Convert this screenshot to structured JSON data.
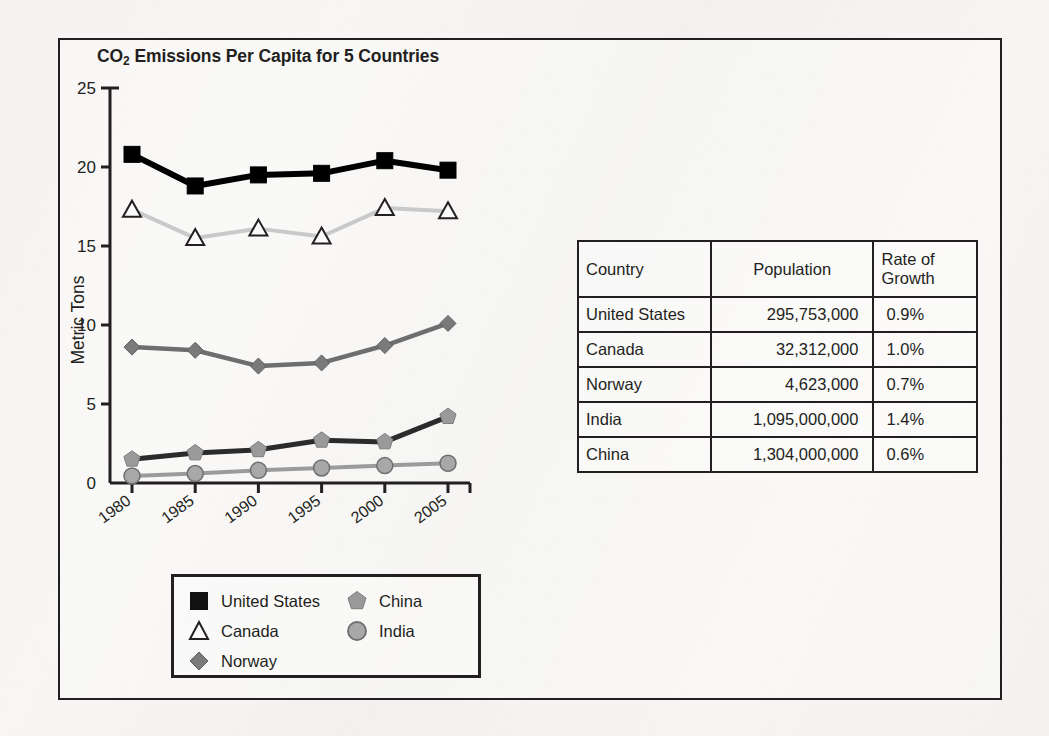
{
  "chart_data": {
    "type": "line",
    "title": "CO2 Emissions Per Capita for 5 Countries",
    "title_prefix": "CO",
    "title_sub": "2",
    "title_rest": " Emissions Per Capita for 5 Countries",
    "xlabel": "",
    "ylabel": "Metric Tons",
    "ylim": [
      0,
      25
    ],
    "yticks": [
      0,
      5,
      10,
      15,
      20,
      25
    ],
    "ytick_labels": [
      "0",
      "5",
      "10",
      "15",
      "20",
      "25"
    ],
    "categories": [
      "1980",
      "1985",
      "1990",
      "1995",
      "2000",
      "2005"
    ],
    "xtick_labels": [
      "1980",
      "1985",
      "1990",
      "1995",
      "2000",
      "2005"
    ],
    "grid": false,
    "legend_position": "bottom-left",
    "series": [
      {
        "name": "United States",
        "marker": "square",
        "color": "#000000",
        "line_color": "#000000",
        "values": [
          20.8,
          18.8,
          19.5,
          19.6,
          20.4,
          19.8
        ]
      },
      {
        "name": "Canada",
        "marker": "triangle-open",
        "color": "#ffffff",
        "line_color": "#c9c9c9",
        "values": [
          17.3,
          15.5,
          16.1,
          15.6,
          17.4,
          17.2
        ]
      },
      {
        "name": "Norway",
        "marker": "diamond",
        "color": "#7a7a7a",
        "line_color": "#6e6e6e",
        "values": [
          8.6,
          8.4,
          7.4,
          7.6,
          8.7,
          10.1
        ]
      },
      {
        "name": "China",
        "marker": "pentagon",
        "color": "#9a9a9a",
        "line_color": "#2b2b2b",
        "values": [
          1.5,
          1.9,
          2.1,
          2.7,
          2.6,
          4.2
        ]
      },
      {
        "name": "India",
        "marker": "circle",
        "color": "#a8a8a8",
        "line_color": "#9b9b9b",
        "values": [
          0.45,
          0.6,
          0.8,
          0.95,
          1.1,
          1.25
        ]
      }
    ]
  },
  "table": {
    "headers": [
      "Country",
      "Population",
      "Rate of Growth"
    ],
    "header_country": "Country",
    "header_population": "Population",
    "header_rate_line1": "Rate of",
    "header_rate_line2": "Growth",
    "rows": [
      {
        "country": "United States",
        "population": "295,753,000",
        "rate": "0.9%"
      },
      {
        "country": "Canada",
        "population": "32,312,000",
        "rate": "1.0%"
      },
      {
        "country": "Norway",
        "population": "4,623,000",
        "rate": "0.7%"
      },
      {
        "country": "India",
        "population": "1,095,000,000",
        "rate": "1.4%"
      },
      {
        "country": "China",
        "population": "1,304,000,000",
        "rate": "0.6%"
      }
    ]
  },
  "legend": {
    "left_column": [
      {
        "label": "United States",
        "marker": "square-filled-black"
      },
      {
        "label": "Canada",
        "marker": "triangle-open"
      },
      {
        "label": "Norway",
        "marker": "diamond-gray"
      }
    ],
    "right_column": [
      {
        "label": "China",
        "marker": "pentagon-gray"
      },
      {
        "label": "India",
        "marker": "circle-gray"
      }
    ]
  },
  "colors": {
    "ink": "#231f20",
    "us": "#000000",
    "canada_line": "#c9c9c9",
    "norway": "#6e6e6e",
    "china_line": "#2b2b2b",
    "china_marker": "#9a9a9a",
    "india": "#a8a8a8",
    "paper": "#f4f3f1"
  }
}
